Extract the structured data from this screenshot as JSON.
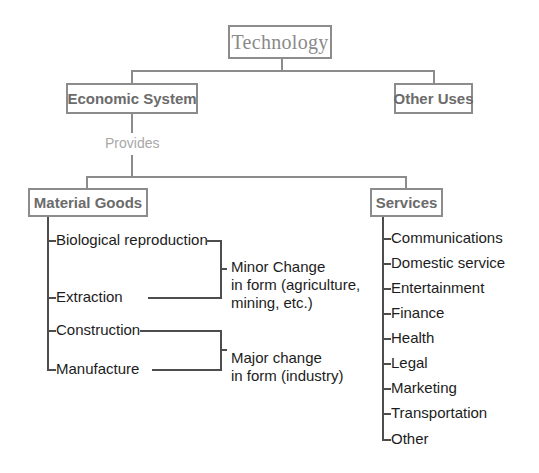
{
  "diagram": {
    "title_node": {
      "label": "Technology"
    },
    "level2": [
      {
        "label": "Economic System"
      },
      {
        "label": "Other Uses"
      }
    ],
    "edge_label": {
      "label": "Provides"
    },
    "level3": [
      {
        "label": "Material Goods"
      },
      {
        "label": "Services"
      }
    ],
    "material_goods_items": [
      {
        "label": "Biological reproduction"
      },
      {
        "label": "Extraction"
      },
      {
        "label": "Construction"
      },
      {
        "label": "Manufacture"
      }
    ],
    "material_goods_groups": [
      {
        "label": "Minor Change\nin form (agriculture,\nmining, etc.)"
      },
      {
        "label": "Major change\nin form (industry)"
      }
    ],
    "services_items": [
      {
        "label": "Communications"
      },
      {
        "label": "Domestic service"
      },
      {
        "label": "Entertainment"
      },
      {
        "label": "Finance"
      },
      {
        "label": "Health"
      },
      {
        "label": "Legal"
      },
      {
        "label": "Marketing"
      },
      {
        "label": "Transportation"
      },
      {
        "label": "Other"
      }
    ],
    "colors": {
      "box_border": "#8c8c8c",
      "box_text": "#6b6b6b",
      "root_text": "#8a8a8a",
      "edge_label_text": "#a8a8a8",
      "leaf_text": "#1c1c1c",
      "leaf_line": "#4d4d4d",
      "background": "#ffffff"
    }
  }
}
